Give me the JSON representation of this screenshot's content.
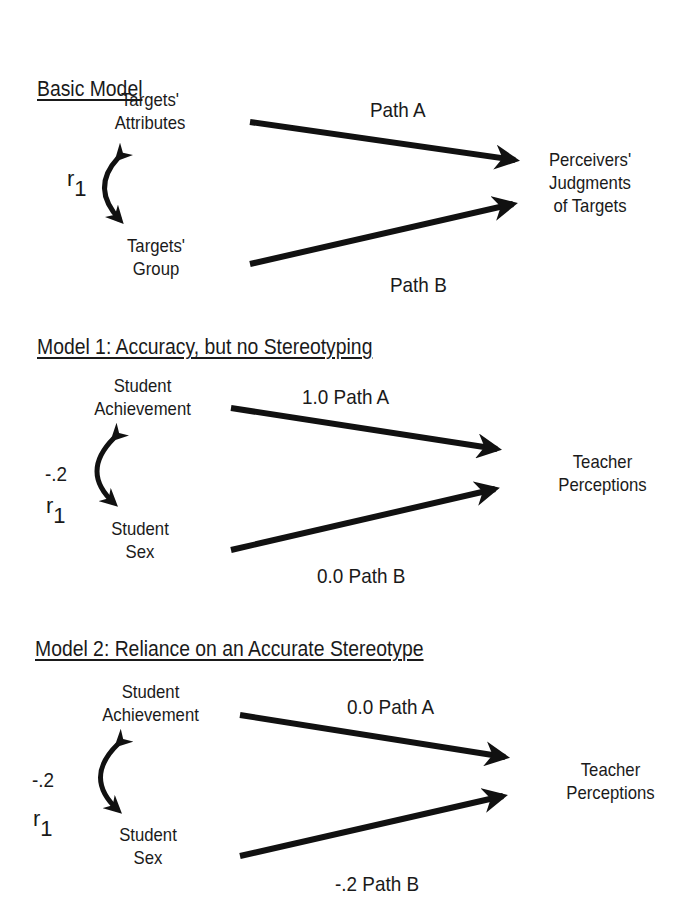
{
  "panels": [
    {
      "title": "Basic Model",
      "top_node": [
        "Targets'",
        "Attributes"
      ],
      "bottom_node": [
        "Targets'",
        "Group"
      ],
      "outcome": [
        "Perceivers'",
        "Judgments",
        "of Targets"
      ],
      "path_a": "Path A",
      "path_b": "Path B",
      "correlation_value": "",
      "correlation_label": "r",
      "correlation_sub": "1"
    },
    {
      "title": "Model 1: Accuracy, but no Stereotyping",
      "top_node": [
        "Student",
        "Achievement"
      ],
      "bottom_node": [
        "Student",
        "Sex"
      ],
      "outcome": [
        "Teacher",
        "Perceptions"
      ],
      "path_a": "1.0  Path A",
      "path_b": "0.0   Path B",
      "correlation_value": "-.2",
      "correlation_label": "r",
      "correlation_sub": "1"
    },
    {
      "title": "Model 2: Reliance on an Accurate Stereotype",
      "top_node": [
        "Student",
        "Achievement"
      ],
      "bottom_node": [
        "Student",
        "Sex"
      ],
      "outcome": [
        "Teacher",
        "Perceptions"
      ],
      "path_a": "0.0 Path A",
      "path_b": "-.2 Path B",
      "correlation_value": "-.2",
      "correlation_label": "r",
      "correlation_sub": "1"
    }
  ]
}
